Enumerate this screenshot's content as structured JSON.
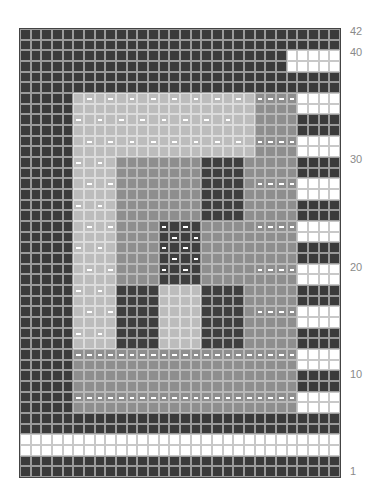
{
  "grid": {
    "columns": 30,
    "rows": 42,
    "legend": {
      "D": "dark stitch",
      "W": "white stitch",
      "L": "light gray stitch",
      "l": "light gray stitch with purl dash",
      "M": "mid gray stitch",
      "m": "mid gray stitch with purl dash",
      "G": "dark gray motif stitch",
      "g": "dark gray motif stitch with purl dash"
    },
    "colors": {
      "D": "#3a3a3a",
      "W": "#ffffff",
      "L": "#bcbcbc",
      "M": "#8e8e8e",
      "G": "#3e3e3e"
    },
    "rows_top_to_bottom": [
      "DDDDDDDDDDDDDDDDDDDDDDDDDDDDDD",
      "DDDDDDDDDDDDDDDDDDDDDDDDDDDDDD",
      "DDDDDDDDDDDDDDDDDDDDDDDDDWWWWW",
      "DDDDDDDDDDDDDDDDDDDDDDDDDWWWWW",
      "DDDDDDDDDDDDDDDDDDDDDDDDDDDDDD",
      "DDDDDDDDDDDDDDDDDDDDDDDDDDDDDD",
      "DDDDDLlLlLlLlLlLlLlLlLmmmmWWWWW",
      "DDDDDLLLLLLLLLLLLLLLLLMMMMWWWWW",
      "DDDDDlLlLlLlLlLlLlLlLLMMMMDDDDD",
      "DDDDDLLLLLLLLLLLLLLLLLMMMMDDDDD",
      "DDDDDLlLlLlLlLlLlLlLlLmmmmWWWWW",
      "DDDDDLLLLLLLLLLLLLLLLLMMMMWWWWW",
      "DDDDDlLlLMMMMMMMMGGGGMMMMMDDDDD",
      "DDDDDLLLLMMMMMMMMGGGGMMMMMDDDDD",
      "DDDDDLlLlMMMMMMMMGGGGMmmmmWWWWW",
      "DDDDDLLLLMMMMMMMMGGGGMMMMMWWWWW",
      "DDDDDlLlLMMMMMMMMGGGGMMMMMDDDDD",
      "DDDDDLLLLMMMMMMMMGGGGMMMMMDDDDD",
      "DDDDDLlLlMMMMgGgGMMMMMmmmmWWWWW",
      "DDDDDLLLLMMMMGgGgMMMMMMMMMWWWWW",
      "DDDDDlLlLMMMMgGgGMMMMMMMMMDDDDD",
      "DDDDDLLLLMMMMGgGgMMMMMMMMMDDDDD",
      "DDDDDLlLlMMMMgGgGMMMMMmmmmWWWWW",
      "DDDDDLLLLMMMMGGGGMMMMMMMMMWWWWW",
      "DDDDDlLlLGGGGLLLLGGGGMMMMMDDDDD",
      "DDDDDLLLLGGGGLLLLGGGGMMMMMDDDDD",
      "DDDDDLlLlGGGGLLLLGGGGMmmmmWWWWW",
      "DDDDDLLLLGGGGLLLLGGGGMMMMMWWWWW",
      "DDDDDlLlLGGGGLLLLGGGGMMMMMDDDDD",
      "DDDDDLLLLGGGGLLLLGGGGMMMMMDDDDD",
      "DDDDDmmmmmmmmmmmmmmmmmmmmmWWWWW",
      "DDDDDMMMMMMMMMMMMMMMMMMMMMWWWWW",
      "DDDDDMMMMMMMMMMMMMMMMMMMMMDDDDD",
      "DDDDDMMMMMMMMMMMMMMMMMMMMMDDDDD",
      "DDDDDmmmmmmmmmmmmmmmmmmmmmWWWWW",
      "DDDDDMMMMMMMMMMMMMMMMMMMMMWWWWW",
      "DDDDDDDDDDDDDDDDDDDDDDDDDDDDDD",
      "DDDDDDDDDDDDDDDDDDDDDDDDDDDDDD",
      "WWWWWWWWWWWWWWWWWWWWWWWWWWWWWW",
      "WWWWWWWWWWWWWWWWWWWWWWWWWWWWWW",
      "DDDDDDDDDDDDDDDDDDDDDDDDDDDDDD",
      "DDDDDDDDDDDDDDDDDDDDDDDDDDDDDD"
    ]
  },
  "row_labels": [
    {
      "text": "42",
      "row": 42
    },
    {
      "text": "40",
      "row": 40
    },
    {
      "text": "30",
      "row": 30
    },
    {
      "text": "20",
      "row": 20
    },
    {
      "text": "10",
      "row": 10
    },
    {
      "text": "1",
      "row": 1
    }
  ]
}
